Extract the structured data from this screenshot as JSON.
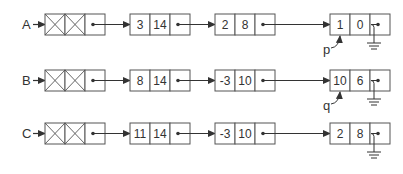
{
  "diagram": {
    "title": "",
    "colors": {
      "stroke": "#555555",
      "text": "#333333",
      "background": "#ffffff"
    },
    "lists": [
      {
        "label": "A",
        "nodes": [
          {
            "coef": "3",
            "exp": "14"
          },
          {
            "coef": "2",
            "exp": "8"
          },
          {
            "coef": "1",
            "exp": "0"
          }
        ],
        "pointer": {
          "name": "p",
          "target_node_index": 2
        }
      },
      {
        "label": "B",
        "nodes": [
          {
            "coef": "8",
            "exp": "14"
          },
          {
            "coef": "-3",
            "exp": "10"
          },
          {
            "coef": "10",
            "exp": "6"
          }
        ],
        "pointer": {
          "name": "q",
          "target_node_index": 2
        }
      },
      {
        "label": "C",
        "nodes": [
          {
            "coef": "11",
            "exp": "14"
          },
          {
            "coef": "-3",
            "exp": "10"
          },
          {
            "coef": "2",
            "exp": "8"
          }
        ],
        "pointer": null
      }
    ],
    "icons": {
      "header_cell": "x-cross-icon",
      "terminator": "ground-null-icon"
    }
  }
}
